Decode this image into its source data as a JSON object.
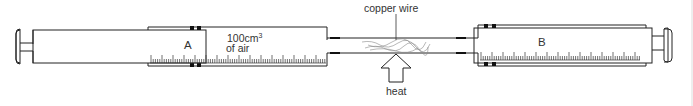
{
  "diagram": {
    "type": "apparatus",
    "components": {
      "syringe_a": {
        "label": "A",
        "contents_line1": "100cm",
        "contents_sup": "3",
        "contents_line2": "of air"
      },
      "syringe_b": {
        "label": "B"
      },
      "tube": {
        "label": "copper wire"
      },
      "heat": {
        "label": "heat"
      }
    },
    "colors": {
      "line": "#222222",
      "text": "#333333",
      "wire": "#888888",
      "background": "#ffffff"
    }
  }
}
